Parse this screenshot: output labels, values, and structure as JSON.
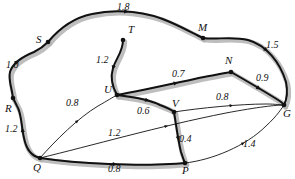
{
  "figure": {
    "type": "weighted-undirected-graph-diagram",
    "background_color": "#ffffff",
    "edge_color": "#111111",
    "highlight_color": "#b3b3b3"
  },
  "nodes": [
    {
      "id": "S",
      "label": "S",
      "x": 48,
      "y": 42,
      "label_x": 36,
      "label_y": 34,
      "dot": true
    },
    {
      "id": "M",
      "label": "M",
      "x": 203,
      "y": 38,
      "label_x": 198,
      "label_y": 22,
      "dot": true
    },
    {
      "id": "T",
      "label": "T",
      "x": 123,
      "y": 40,
      "label_x": 128,
      "label_y": 24,
      "dot": true
    },
    {
      "id": "N",
      "label": "N",
      "x": 231,
      "y": 72,
      "label_x": 225,
      "label_y": 55,
      "dot": true
    },
    {
      "id": "G",
      "label": "G",
      "x": 284,
      "y": 105,
      "label_x": 283,
      "label_y": 108,
      "dot": true
    },
    {
      "id": "U",
      "label": "U",
      "x": 117,
      "y": 95,
      "label_x": 104,
      "label_y": 84,
      "dot": true
    },
    {
      "id": "V",
      "label": "V",
      "x": 174,
      "y": 112,
      "label_x": 172,
      "label_y": 98,
      "dot": true
    },
    {
      "id": "P",
      "label": "P",
      "x": 185,
      "y": 163,
      "label_x": 182,
      "label_y": 165,
      "dot": true
    },
    {
      "id": "Q",
      "label": "Q",
      "x": 40,
      "y": 158,
      "label_x": 33,
      "label_y": 162,
      "dot": true
    },
    {
      "id": "R",
      "label": "R",
      "x": 13,
      "y": 98,
      "label_x": 5,
      "label_y": 103,
      "dot": true
    }
  ],
  "edges": [
    {
      "id": "R-S",
      "from": "R",
      "to": "S",
      "weight": "1.0",
      "label_x": 6,
      "label_y": 60,
      "highlighted": true,
      "path": "M 13 98 C 12 88 8 80 10 72 C 13 62 24 56 34 52 C 40 49 44 46 48 42"
    },
    {
      "id": "S-M",
      "from": "S",
      "to": "M",
      "weight": "1.8",
      "label_x": 117,
      "label_y": 2,
      "highlighted": true,
      "path": "M 48 42 C 58 30 72 18 92 14 C 118 8 148 12 170 22 C 186 29 194 34 203 38"
    },
    {
      "id": "M-G",
      "from": "M",
      "to": "G",
      "weight": "1.5",
      "label_x": 266,
      "label_y": 40,
      "highlighted": true,
      "path": "M 203 38 C 216 40 232 36 248 40 C 266 45 280 62 286 82 C 288 92 287 99 284 105"
    },
    {
      "id": "T-U",
      "from": "T",
      "to": "U",
      "weight": "1.2",
      "label_x": 96,
      "label_y": 55,
      "highlighted": true,
      "path": "M 123 40 C 123 52 116 58 113 68 C 110 78 113 88 117 95"
    },
    {
      "id": "U-N",
      "from": "U",
      "to": "N",
      "weight": "0.7",
      "label_x": 172,
      "label_y": 69,
      "highlighted": true,
      "path": "M 117 95 C 145 90 180 82 204 77 C 215 75 224 73 231 72"
    },
    {
      "id": "N-G",
      "from": "N",
      "to": "G",
      "weight": "0.9",
      "label_x": 256,
      "label_y": 73,
      "highlighted": true,
      "path": "M 231 72 C 245 80 262 90 275 98 C 280 101 283 103 284 105"
    },
    {
      "id": "Q-R",
      "from": "Q",
      "to": "R",
      "weight": "1.2",
      "label_x": 5,
      "label_y": 124,
      "highlighted": true,
      "path": "M 40 158 C 31 156 26 148 24 138 C 21 126 22 114 17 106 C 15 102 14 100 13 98"
    },
    {
      "id": "Q-U",
      "from": "Q",
      "to": "U",
      "weight": "0.8",
      "label_x": 66,
      "label_y": 98,
      "highlighted": false,
      "path": "M 40 158 C 56 140 78 118 98 106 C 107 101 113 97 117 95"
    },
    {
      "id": "U-V",
      "from": "U",
      "to": "V",
      "weight": "0.6",
      "label_x": 137,
      "label_y": 106,
      "highlighted": true,
      "path": "M 117 95 C 134 97 150 100 160 105 C 168 108 172 110 174 112"
    },
    {
      "id": "V-G",
      "from": "V",
      "to": "G",
      "weight": "0.8",
      "label_x": 216,
      "label_y": 92,
      "highlighted": false,
      "path": "M 174 112 C 200 108 240 104 266 104 C 276 104 281 105 284 105"
    },
    {
      "id": "Q-G",
      "from": "Q",
      "to": "G",
      "weight": "1.2",
      "label_x": 108,
      "label_y": 128,
      "highlighted": false,
      "path": "M 40 158 C 90 146 160 126 226 113 C 258 107 276 105 284 105"
    },
    {
      "id": "V-P",
      "from": "V",
      "to": "P",
      "weight": "0.4",
      "label_x": 179,
      "label_y": 134,
      "highlighted": true,
      "path": "M 174 112 C 176 124 178 140 181 152 C 183 158 184 161 185 163"
    },
    {
      "id": "Q-P",
      "from": "Q",
      "to": "P",
      "weight": "0.8",
      "label_x": 108,
      "label_y": 164,
      "highlighted": true,
      "path": "M 40 158 C 80 164 140 166 170 164 C 179 164 183 163 185 163"
    },
    {
      "id": "P-G",
      "from": "P",
      "to": "G",
      "weight": "1.4",
      "label_x": 243,
      "label_y": 139,
      "highlighted": false,
      "path": "M 185 163 C 212 160 246 146 266 126 C 277 116 282 108 284 105"
    }
  ]
}
